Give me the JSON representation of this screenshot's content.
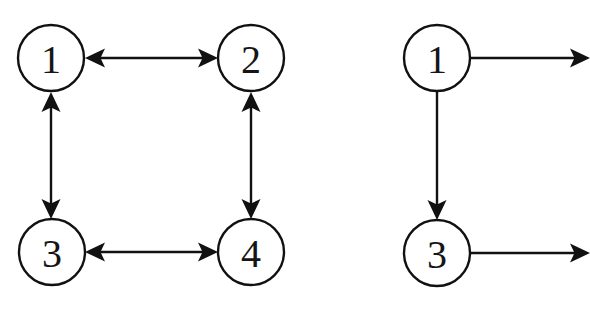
{
  "figure": {
    "type": "diagram",
    "subtype": "directed-graph",
    "background_color": "#ffffff",
    "stroke_color": "#111111",
    "label_color": "#151515",
    "width": 590,
    "height": 313,
    "node_radius": 33,
    "panel_count": 2
  },
  "panels": [
    {
      "id": "left-graph",
      "name": "fully-connected-square-graph",
      "cropped": false,
      "nodes": [
        {
          "id": "L1",
          "label": "1",
          "cx": 51,
          "cy": 58
        },
        {
          "id": "L2",
          "label": "2",
          "cx": 251,
          "cy": 58
        },
        {
          "id": "L3",
          "label": "3",
          "cx": 52,
          "cy": 252
        },
        {
          "id": "L4",
          "label": "4",
          "cx": 251,
          "cy": 252
        }
      ],
      "edges": [
        {
          "id": "L1-L2",
          "from": "1",
          "to": "2",
          "orientation": "horizontal",
          "direction": "bidirectional",
          "x1": 85,
          "y1": 58,
          "x2": 218,
          "y2": 58
        },
        {
          "id": "L1-L3",
          "from": "1",
          "to": "3",
          "orientation": "vertical",
          "direction": "bidirectional",
          "x1": 51,
          "y1": 92,
          "x2": 51,
          "y2": 219
        },
        {
          "id": "L2-L4",
          "from": "2",
          "to": "4",
          "orientation": "vertical",
          "direction": "bidirectional",
          "x1": 251,
          "y1": 92,
          "x2": 251,
          "y2": 219
        },
        {
          "id": "L3-L4",
          "from": "3",
          "to": "4",
          "orientation": "horizontal",
          "direction": "bidirectional",
          "x1": 85,
          "y1": 252,
          "x2": 218,
          "y2": 252
        }
      ]
    },
    {
      "id": "right-graph",
      "name": "partial-graph-cropped",
      "cropped": true,
      "nodes": [
        {
          "id": "R1",
          "label": "1",
          "cx": 437,
          "cy": 58
        },
        {
          "id": "R3",
          "label": "3",
          "cx": 437,
          "cy": 253
        }
      ],
      "edges": [
        {
          "id": "R1-out",
          "from": "1",
          "to": "",
          "orientation": "horizontal",
          "direction": "forward",
          "x1": 471,
          "y1": 58,
          "x2": 590,
          "y2": 58
        },
        {
          "id": "R1-R3",
          "from": "1",
          "to": "3",
          "orientation": "vertical",
          "direction": "forward",
          "x1": 437,
          "y1": 92,
          "x2": 437,
          "y2": 220
        },
        {
          "id": "R3-out",
          "from": "3",
          "to": "",
          "orientation": "horizontal",
          "direction": "forward",
          "x1": 471,
          "y1": 253,
          "x2": 590,
          "y2": 253
        }
      ]
    }
  ]
}
